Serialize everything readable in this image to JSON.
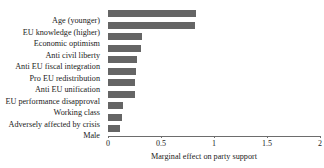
{
  "chart_data": {
    "type": "bar",
    "orientation": "horizontal",
    "title": "",
    "xlabel": "Marginal effect on party support",
    "ylabel": "",
    "xlim": [
      0,
      2
    ],
    "xticks": [
      "0",
      "0.5",
      "1",
      "1.5",
      "2"
    ],
    "xtick_values": [
      0,
      0.5,
      1,
      1.5,
      2
    ],
    "grid": false,
    "legend": false,
    "bar_color": "#656565",
    "categories": [
      "Age (younger)",
      "EU knowledge (higher)",
      "Economic optimism",
      "Anti civil liberty",
      "Anti EU fiscal integration",
      "Pro EU redistribution",
      "Anti EU unification",
      "EU performance disapproval",
      "Working class",
      "Adversely affected by crisis",
      "Male"
    ],
    "values": [
      0.83,
      0.82,
      0.32,
      0.31,
      0.27,
      0.26,
      0.25,
      0.25,
      0.14,
      0.13,
      0.11
    ]
  }
}
